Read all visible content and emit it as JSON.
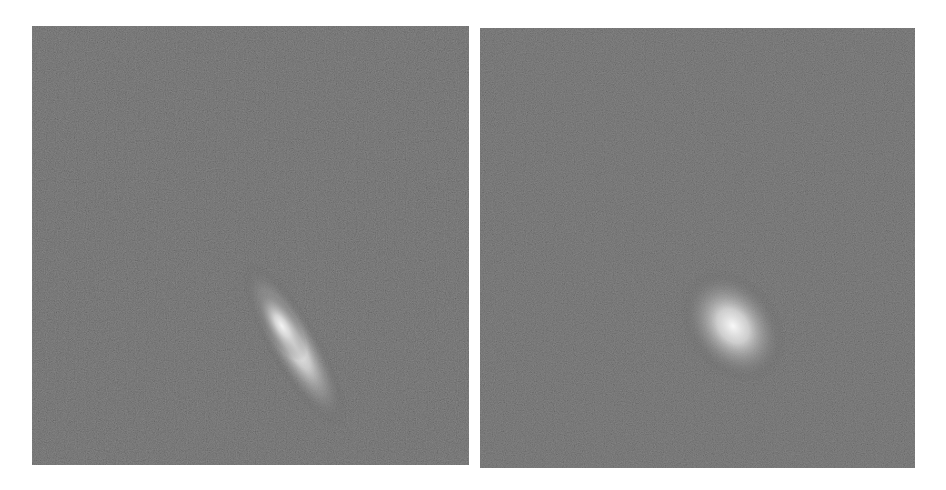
{
  "figure": {
    "panels": [
      {
        "id": "left",
        "description": "grayscale noise field with elongated bright streak",
        "background_color": "#555555",
        "feature": {
          "type": "streak",
          "center": [
            258,
            298
          ],
          "length": 150,
          "width": 34,
          "angle_deg": 58,
          "peak_color": "#f4f4f4"
        }
      },
      {
        "id": "right",
        "description": "grayscale noise field with compact bright blob",
        "background_color": "#555555",
        "feature": {
          "type": "blob",
          "center": [
            250,
            293
          ],
          "rx": 40,
          "ry": 55,
          "angle_deg": -35,
          "peak_color": "#f8f8f8"
        }
      }
    ]
  }
}
